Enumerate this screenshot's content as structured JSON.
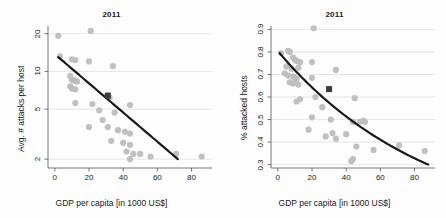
{
  "figure": {
    "background_color": "#fdfdfd",
    "point_color": "#bdbdbd",
    "line_color": "#1a1a1a",
    "grid_color": "#d8dce4",
    "axis_color": "#555555",
    "highlight_color": "#3a3a3a"
  },
  "panels": [
    {
      "id": "left",
      "title": "2011",
      "xlabel": "GDP per capita [in 1000 US$]",
      "ylabel": "Avg. # attacks per host"
    },
    {
      "id": "right",
      "title": "2011",
      "xlabel": "GDP per capita [in 1000 US$]",
      "ylabel": "% attacked hosts"
    }
  ],
  "chart_data": [
    {
      "type": "scatter",
      "title": "2011",
      "xlabel": "GDP per capita [in 1000 US$]",
      "ylabel": "Avg. # attacks per host",
      "xlim": [
        -4,
        92
      ],
      "ylim": [
        1.7,
        23
      ],
      "yscale": "log",
      "xscale": "linear",
      "grid": true,
      "xticks": [
        0,
        20,
        40,
        60,
        80
      ],
      "xtick_labels": [
        "0",
        "20",
        "40",
        "60",
        "80"
      ],
      "yticks": [
        2,
        5,
        10,
        20
      ],
      "ytick_labels": [
        "2",
        "5",
        "10",
        "20"
      ],
      "legend": "none",
      "points": [
        [
          2,
          19.2
        ],
        [
          21,
          21.0
        ],
        [
          3,
          13.2
        ],
        [
          10,
          12.5
        ],
        [
          12,
          12.3
        ],
        [
          20,
          12.0
        ],
        [
          34,
          11.0
        ],
        [
          9,
          9.2
        ],
        [
          10,
          8.6
        ],
        [
          11,
          8.5
        ],
        [
          12,
          8.4
        ],
        [
          13,
          8.3
        ],
        [
          9,
          7.6
        ],
        [
          10,
          7.3
        ],
        [
          12,
          7.2
        ],
        [
          31,
          6.3
        ],
        [
          32,
          6.2
        ],
        [
          12,
          5.6
        ],
        [
          22,
          5.5
        ],
        [
          44,
          5.4
        ],
        [
          26,
          4.9
        ],
        [
          35,
          4.7
        ],
        [
          28,
          4.1
        ],
        [
          20,
          3.6
        ],
        [
          31,
          3.6
        ],
        [
          37,
          3.4
        ],
        [
          41,
          3.3
        ],
        [
          44,
          3.2
        ],
        [
          33,
          2.8
        ],
        [
          40,
          2.7
        ],
        [
          44,
          2.6
        ],
        [
          42,
          2.3
        ],
        [
          46,
          2.2
        ],
        [
          50,
          2.2
        ],
        [
          56,
          2.1
        ],
        [
          44,
          2.0
        ],
        [
          71,
          2.2
        ],
        [
          86,
          2.1
        ],
        [
          31,
          6.5
        ]
      ],
      "highlight_point": [
        31,
        6.4
      ],
      "trend": {
        "type": "log-linear",
        "x_start": 2,
        "x_end": 72,
        "y_start": 13.0,
        "y_end": 2.0
      }
    },
    {
      "type": "scatter",
      "title": "2011",
      "xlabel": "GDP per capita [in 1000 US$]",
      "ylabel": "% attacked hosts",
      "xlim": [
        -4,
        92
      ],
      "ylim": [
        0.285,
        0.915
      ],
      "yscale": "linear",
      "xscale": "linear",
      "grid": true,
      "xticks": [
        0,
        20,
        40,
        60,
        80
      ],
      "xtick_labels": [
        "0",
        "20",
        "40",
        "60",
        "80"
      ],
      "yticks": [
        0.3,
        0.4,
        0.5,
        0.6,
        0.7,
        0.8,
        0.9
      ],
      "ytick_labels": [
        "0.3",
        "0.4",
        "0.5",
        "0.6",
        "0.7",
        "0.8",
        "0.9"
      ],
      "legend": "none",
      "points": [
        [
          21,
          0.905
        ],
        [
          2,
          0.795
        ],
        [
          6,
          0.805
        ],
        [
          7,
          0.8
        ],
        [
          9,
          0.775
        ],
        [
          10,
          0.765
        ],
        [
          11,
          0.76
        ],
        [
          20,
          0.755
        ],
        [
          5,
          0.735
        ],
        [
          8,
          0.725
        ],
        [
          12,
          0.73
        ],
        [
          13,
          0.755
        ],
        [
          34,
          0.72
        ],
        [
          4,
          0.705
        ],
        [
          6,
          0.695
        ],
        [
          9,
          0.69
        ],
        [
          10,
          0.685
        ],
        [
          11,
          0.68
        ],
        [
          20,
          0.685
        ],
        [
          7,
          0.665
        ],
        [
          9,
          0.66
        ],
        [
          12,
          0.655
        ],
        [
          13,
          0.59
        ],
        [
          22,
          0.6
        ],
        [
          45,
          0.595
        ],
        [
          11,
          0.58
        ],
        [
          26,
          0.555
        ],
        [
          20,
          0.51
        ],
        [
          31,
          0.5
        ],
        [
          44,
          0.49
        ],
        [
          48,
          0.49
        ],
        [
          50,
          0.495
        ],
        [
          51,
          0.49
        ],
        [
          18,
          0.455
        ],
        [
          32,
          0.44
        ],
        [
          28,
          0.425
        ],
        [
          40,
          0.435
        ],
        [
          34,
          0.415
        ],
        [
          44,
          0.325
        ],
        [
          43,
          0.315
        ],
        [
          46,
          0.38
        ],
        [
          56,
          0.365
        ],
        [
          71,
          0.385
        ],
        [
          86,
          0.36
        ]
      ],
      "highlight_point": [
        30,
        0.635
      ],
      "trend": {
        "type": "decay",
        "x_start": 1,
        "x_end": 88,
        "y_start": 0.795,
        "y_end": 0.3
      }
    }
  ]
}
